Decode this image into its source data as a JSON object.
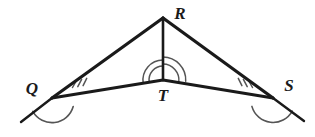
{
  "figure": {
    "background_color": "#ffffff",
    "stroke_color": "#1a1a1a",
    "mark_color": "#4d4d4d",
    "width": 315,
    "height": 137
  },
  "labels": {
    "r": "R",
    "q": "Q",
    "t": "T",
    "s": "S"
  },
  "points": {
    "R": {
      "x": 163,
      "y": 18
    },
    "Q": {
      "x": 52,
      "y": 98
    },
    "T": {
      "x": 163,
      "y": 80
    },
    "S": {
      "x": 273,
      "y": 98
    },
    "ray_left_end": {
      "x": 21,
      "y": 122
    },
    "ray_right_end": {
      "x": 304,
      "y": 121
    }
  },
  "label_positions": {
    "R": {
      "x": 180,
      "y": 13
    },
    "Q": {
      "x": 32,
      "y": 88
    },
    "T": {
      "x": 163,
      "y": 95
    },
    "S": {
      "x": 289,
      "y": 85
    }
  },
  "segments": [
    {
      "name": "segment-QR",
      "from": "Q",
      "to": "R"
    },
    {
      "name": "segment-RS",
      "from": "R",
      "to": "S"
    },
    {
      "name": "segment-RT",
      "from": "R",
      "to": "T"
    },
    {
      "name": "segment-QT",
      "from": "Q",
      "to": "T"
    },
    {
      "name": "segment-TS",
      "from": "T",
      "to": "S"
    },
    {
      "name": "ray-beyond-Q",
      "from": "Q",
      "to": "ray_left_end"
    },
    {
      "name": "ray-beyond-S",
      "from": "S",
      "to": "ray_right_end"
    }
  ],
  "angle_marks": {
    "t_left": {
      "label": "angle RTQ",
      "arcs": 2,
      "radii": [
        14,
        20
      ]
    },
    "t_right": {
      "label": "angle RTS",
      "arcs": 2,
      "radii": [
        16,
        23
      ]
    },
    "q_interior": {
      "label": "angle RQT",
      "ticks": 3
    },
    "s_interior": {
      "label": "angle RST",
      "ticks": 3
    },
    "q_exterior": {
      "label": "exterior angle at Q",
      "arcs": 1,
      "radius": 22
    },
    "s_exterior": {
      "label": "exterior angle at S",
      "arcs": 1,
      "radius": 22
    }
  }
}
